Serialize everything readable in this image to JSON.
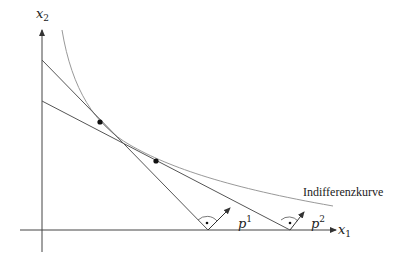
{
  "diagram": {
    "axes": {
      "x": {
        "label": "x",
        "subscript": "1"
      },
      "y": {
        "label": "x",
        "subscript": "2"
      }
    },
    "curve_label": "Indifferenzkurve",
    "vectors": [
      {
        "label": "p",
        "superscript": "1"
      },
      {
        "label": "p",
        "superscript": "2"
      }
    ],
    "colors": {
      "axis": "#444444",
      "budget_line": "#555555",
      "curve": "#888888",
      "point": "#111111"
    }
  }
}
